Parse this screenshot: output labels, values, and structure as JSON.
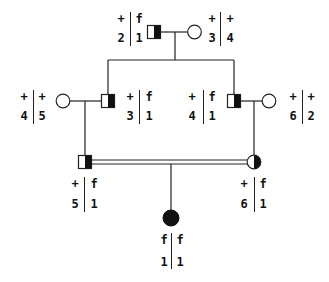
{
  "diagram": {
    "type": "pedigree",
    "colors": {
      "line": "#222222",
      "fill": "#111111",
      "background": "#ffffff"
    },
    "individuals": [
      {
        "id": "I-1",
        "sex": "male",
        "status": "carrier-half",
        "haplotypes": {
          "left": [
            "+",
            "2"
          ],
          "right": [
            "f",
            "1"
          ]
        }
      },
      {
        "id": "I-2",
        "sex": "female",
        "status": "unaffected",
        "haplotypes": {
          "left": [
            "+",
            "3"
          ],
          "right": [
            "+",
            "4"
          ]
        }
      },
      {
        "id": "II-1",
        "sex": "female",
        "status": "unaffected",
        "haplotypes": {
          "left": [
            "+",
            "4"
          ],
          "right": [
            "+",
            "5"
          ]
        }
      },
      {
        "id": "II-2",
        "sex": "male",
        "status": "carrier-half",
        "haplotypes": {
          "left": [
            "+",
            "3"
          ],
          "right": [
            "f",
            "1"
          ]
        }
      },
      {
        "id": "II-3",
        "sex": "male",
        "status": "carrier-half",
        "haplotypes": {
          "left": [
            "+",
            "4"
          ],
          "right": [
            "f",
            "1"
          ]
        }
      },
      {
        "id": "II-4",
        "sex": "female",
        "status": "unaffected",
        "haplotypes": {
          "left": [
            "+",
            "6"
          ],
          "right": [
            "+",
            "2"
          ]
        }
      },
      {
        "id": "III-1",
        "sex": "male",
        "status": "carrier-half",
        "haplotypes": {
          "left": [
            "+",
            "5"
          ],
          "right": [
            "f",
            "1"
          ]
        }
      },
      {
        "id": "III-2",
        "sex": "female",
        "status": "carrier-half",
        "haplotypes": {
          "left": [
            "+",
            "6"
          ],
          "right": [
            "f",
            "1"
          ]
        }
      },
      {
        "id": "IV-1",
        "sex": "female",
        "status": "affected",
        "haplotypes": {
          "left": [
            "f",
            "1"
          ],
          "right": [
            "f",
            "1"
          ]
        }
      }
    ],
    "relationships": [
      {
        "type": "mating",
        "between": [
          "I-1",
          "I-2"
        ]
      },
      {
        "type": "mating",
        "between": [
          "II-1",
          "II-2"
        ]
      },
      {
        "type": "mating",
        "between": [
          "II-3",
          "II-4"
        ]
      },
      {
        "type": "consanguineous-mating",
        "between": [
          "III-1",
          "III-2"
        ]
      }
    ]
  }
}
